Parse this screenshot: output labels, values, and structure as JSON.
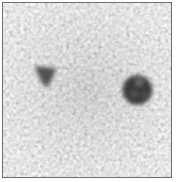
{
  "image": {
    "description": "Grayscale noisy micrograph with two dark particles",
    "background_color": "#b4b4b4",
    "border_color": "#6e6e6e",
    "blobs": [
      {
        "name": "left-particle",
        "shape": "irregular-triangle",
        "cx": 44,
        "cy": 72,
        "r": 11,
        "color": "#3a3a3a"
      },
      {
        "name": "right-particle",
        "shape": "ring",
        "cx": 138,
        "cy": 91,
        "r": 15,
        "color": "#2a2a2a"
      }
    ]
  }
}
